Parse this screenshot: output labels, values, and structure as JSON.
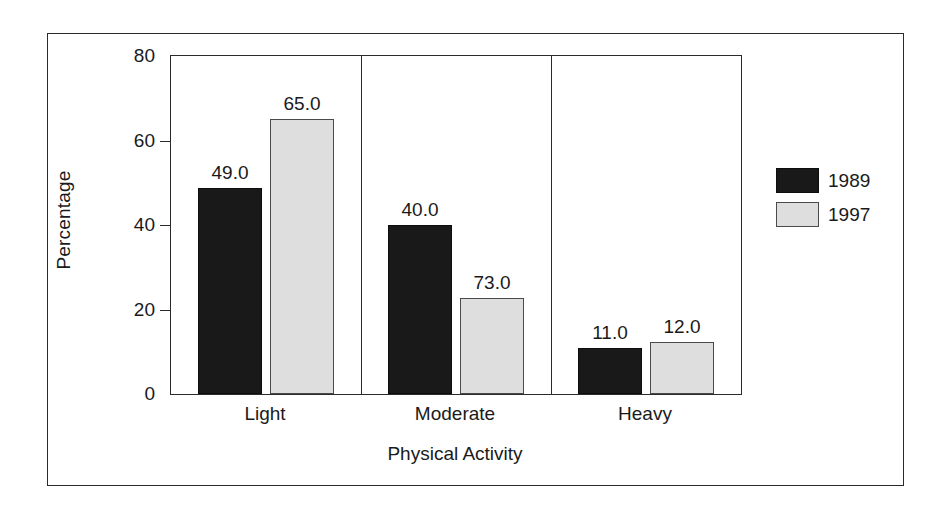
{
  "chart_data": {
    "type": "bar",
    "title": "",
    "xlabel": "Physical Activity",
    "ylabel": "Percentage",
    "categories": [
      "Light",
      "Moderate",
      "Heavy"
    ],
    "series": [
      {
        "name": "1989",
        "color": "#191919",
        "values": [
          49.0,
          40.0,
          11.0
        ],
        "drawn_values": [
          48.7,
          40.0,
          11.0
        ],
        "labels": [
          "49.0",
          "40.0",
          "11.0"
        ]
      },
      {
        "name": "1997",
        "color": "#dedede",
        "values": [
          65.0,
          73.0,
          12.0
        ],
        "drawn_values": [
          65.0,
          22.8,
          12.2
        ],
        "labels": [
          "65.0",
          "73.0",
          "12.0"
        ]
      }
    ],
    "ylim": [
      0,
      80
    ],
    "yticks": [
      0,
      20,
      40,
      60,
      80
    ],
    "ytick_labels": [
      "0",
      "20",
      "40",
      "60",
      "80"
    ],
    "grid": false,
    "legend_position": "right-outside",
    "group_separators": true,
    "frame": true
  },
  "legend": {
    "entries": [
      {
        "label": "1989",
        "swatch": "black-swatch"
      },
      {
        "label": "1997",
        "swatch": "light-gray-swatch"
      }
    ]
  }
}
